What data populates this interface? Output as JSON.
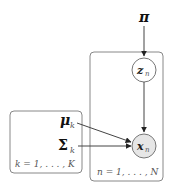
{
  "diagram": {
    "colors": {
      "line": "#444444",
      "plate": "#888888",
      "observed_fill": "#e6e6e6",
      "latent_fill": "#ffffff"
    },
    "nodes": {
      "pi": {
        "label": "π",
        "type": "parameter"
      },
      "z": {
        "label": "z",
        "sub": "n",
        "type": "latent"
      },
      "x": {
        "label": "x",
        "sub": "n",
        "type": "observed"
      },
      "mu": {
        "label": "μ",
        "sub": "k",
        "type": "parameter"
      },
      "sigma": {
        "label": "Σ",
        "sub": "k",
        "type": "parameter"
      }
    },
    "edges": [
      {
        "from": "pi",
        "to": "z"
      },
      {
        "from": "z",
        "to": "x"
      },
      {
        "from": "mu",
        "to": "x"
      },
      {
        "from": "sigma",
        "to": "x"
      }
    ],
    "plates": {
      "components": {
        "label": "k = 1, . . . , K"
      },
      "data": {
        "label": "n = 1, . . . , N"
      }
    }
  }
}
